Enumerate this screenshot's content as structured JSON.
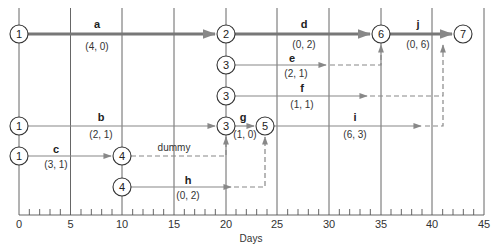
{
  "axis": {
    "label": "Days",
    "ticks": [
      "0",
      "5",
      "10",
      "15",
      "20",
      "25",
      "30",
      "35",
      "40",
      "45"
    ]
  },
  "activities": [
    {
      "id": "a",
      "name": "a",
      "values": "(4, 0)"
    },
    {
      "id": "b",
      "name": "b",
      "values": "(2, 1)"
    },
    {
      "id": "c",
      "name": "c",
      "values": "(3, 1)"
    },
    {
      "id": "d",
      "name": "d",
      "values": "(0, 2)"
    },
    {
      "id": "e",
      "name": "e",
      "values": "(2, 1)"
    },
    {
      "id": "f",
      "name": "f",
      "values": "(1, 1)"
    },
    {
      "id": "g",
      "name": "g",
      "values": "(1, 0)"
    },
    {
      "id": "h",
      "name": "h",
      "values": "(0, 2)"
    },
    {
      "id": "i",
      "name": "i",
      "values": "(6, 3)"
    },
    {
      "id": "j",
      "name": "j",
      "values": "(0, 6)"
    }
  ],
  "dummy_label": "dummy",
  "nodes": {
    "n1a": "1",
    "n1b": "1",
    "n1c": "1",
    "n2": "2",
    "n3a": "3",
    "n3b": "3",
    "n3c": "3",
    "n4a": "4",
    "n4b": "4",
    "n5": "5",
    "n6": "6",
    "n7": "7"
  },
  "colors": {
    "critical": "#777777",
    "arrow": "#888888",
    "dashed": "#888888",
    "grid": "#555555",
    "text": "#222222"
  }
}
